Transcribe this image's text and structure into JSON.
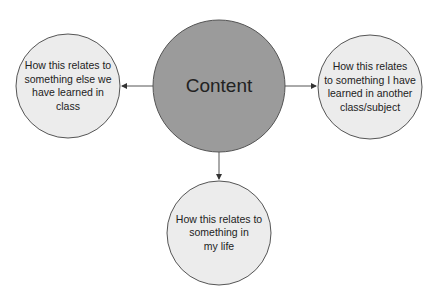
{
  "diagram": {
    "center": {
      "label": "Content",
      "fill": "#9b9b9b"
    },
    "nodes": [
      {
        "id": "left",
        "label": "How this relates to something else we have learned in class",
        "lines": [
          "How this relates to",
          "something else we",
          "have learned in",
          "class"
        ],
        "fill": "#ececec"
      },
      {
        "id": "right",
        "label": "How this relates to something I have learned in another class/subject",
        "lines": [
          "How this relates",
          "to something I have",
          "learned in another",
          "class/subject"
        ],
        "fill": "#ececec"
      },
      {
        "id": "bottom",
        "label": "How this relates to something in my life",
        "lines": [
          "How this relates to",
          "something in",
          "my life"
        ],
        "fill": "#ececec"
      }
    ],
    "edges": [
      {
        "from": "Content",
        "to": "left"
      },
      {
        "from": "Content",
        "to": "right"
      },
      {
        "from": "Content",
        "to": "bottom"
      }
    ]
  }
}
